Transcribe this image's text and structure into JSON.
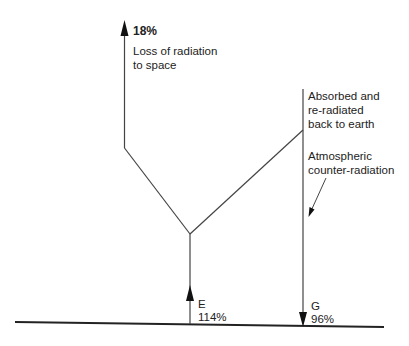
{
  "diagram": {
    "title": "",
    "top_left": {
      "percent": "18%",
      "caption_line1": "Loss of radiation",
      "caption_line2": "to space"
    },
    "right_top": {
      "line1": "Absorbed and",
      "line2": "re-radiated",
      "line3": "back to earth"
    },
    "right_mid": {
      "line1": "Atmospheric",
      "line2": "counter-radiation"
    },
    "earth_emission": {
      "letter": "E",
      "percent": "114%"
    },
    "ground_receipt": {
      "letter": "G",
      "percent": "96%"
    },
    "colors": {
      "line": "#333333",
      "text": "#222222"
    }
  }
}
